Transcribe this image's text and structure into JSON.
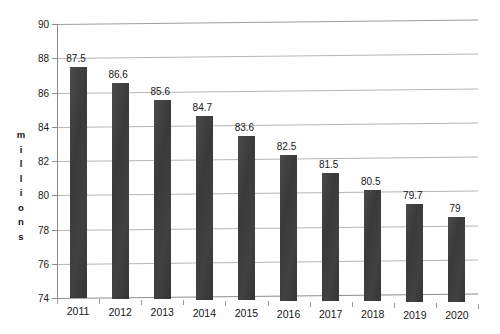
{
  "chart_data": {
    "type": "bar",
    "title": "",
    "subtitle": "",
    "xlabel": "",
    "ylabel": "millions",
    "categories": [
      "2011",
      "2012",
      "2013",
      "2014",
      "2015",
      "2016",
      "2017",
      "2018",
      "2019",
      "2020"
    ],
    "values": [
      87.5,
      86.6,
      85.6,
      84.7,
      83.6,
      82.5,
      81.5,
      80.5,
      79.7,
      79
    ],
    "data_labels": [
      "87.5",
      "86.6",
      "85.6",
      "84.7",
      "83.6",
      "82.5",
      "81.5",
      "80.5",
      "79.7",
      "79"
    ],
    "ylim": [
      74,
      90
    ],
    "ytick_values": [
      90,
      88,
      86,
      84,
      82,
      80,
      78,
      76,
      74
    ],
    "ytick_labels": [
      "90",
      "88",
      "86",
      "84",
      "82",
      "80",
      "78",
      "76",
      "74"
    ],
    "ytick_step": 2,
    "grid": true,
    "grid_axis": "y",
    "legend": false,
    "legend_position": "none",
    "bar_color": "#3f3f3f",
    "gridline_color": "#b6b6b6",
    "axis_color": "#8d8d8d",
    "background_color": "#ffffff",
    "data_label_position": "above-bar"
  },
  "axis": {
    "y_title_letters": [
      "m",
      "i",
      "l",
      "l",
      "i",
      "o",
      "n",
      "s"
    ]
  }
}
